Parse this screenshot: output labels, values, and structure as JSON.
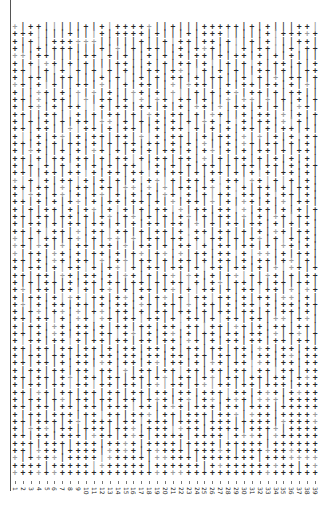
{
  "figure": {
    "title": "",
    "background_color": "#ffffff",
    "width": 324,
    "height": 521
  },
  "axes": {
    "spine_color": "#555555",
    "tick_color": "#777777",
    "y_axis_labels": [],
    "y_axis_title": "",
    "x_axis_title": "",
    "x_tick_rotation": 90
  },
  "markers": {
    "plus_glyph": "+",
    "bar_glyph": "|",
    "plus_color": "#262626",
    "bar_color": "#3a3a3a",
    "faint_color": "#9a9a9a"
  },
  "chart_data": {
    "type": "scatter",
    "title": "",
    "xlabel": "",
    "ylabel": "",
    "grid": false,
    "legend": null,
    "xlim": [
      0.5,
      39.5
    ],
    "ylim": [
      0.5,
      62.5
    ],
    "x_tick_labels": [
      "1",
      "2",
      "3",
      "4",
      "5",
      "6",
      "7",
      "8",
      "9",
      "10",
      "11",
      "12",
      "13",
      "14",
      "15",
      "16",
      "17",
      "18",
      "19",
      "20",
      "21",
      "22",
      "23",
      "24",
      "25",
      "26",
      "27",
      "28",
      "29",
      "30",
      "31",
      "32",
      "33",
      "34",
      "35",
      "36",
      "37",
      "38",
      "39"
    ],
    "y_tick_labels": [],
    "n_columns": 39,
    "n_rows": 62,
    "marker_symbols": [
      "+",
      "|"
    ],
    "series": [
      {
        "name": "plus",
        "symbol": "+",
        "description": "Thick plus-shaped markers arranged on a regular 39-column grid"
      },
      {
        "name": "bar",
        "symbol": "|",
        "description": "Thin vertical-bar markers arranged on the same 39-column grid"
      }
    ],
    "grid_pattern": [
      "+|++|||||+|+|+++++||+|||+++++|+|+|||++|",
      "+++||||+|||+|++++|+|||+|+++|||||+|+++++",
      "+|+||++++++|||||+||+|++|++|+||+|+|||++|",
      "+||+|+++|||+|+|+|++||+|+++|||+|++||+|++",
      "++|++||||++|+|+||+|+|+|++|+|++|+|+|+|||",
      "+|+|++|+|+|||++||+|+|++|+||+|+|+|++|+|+",
      "++||+|+|+|+|+|+||++|++||+|+|+||++|+||++",
      "+|++||++|||+|+||+|+|++|+|++||+|+|+|++|+",
      "++|+|+||++|+||+|++||+|+++||+|++|++|+|+|",
      "+||++|+|+|+|+||++|+|+||+|+|++|++|+|++||",
      "++|+|++||+|++|+|+|++|++|+||+|++|+|+|+|+",
      "+|++|+|++||+|++|++|+|+|++|+|++|+|+||++|",
      "++||++||+|+|++|+|++|++|+|++||+|++|+|+|+",
      "+|+|+|+|++|++|+|+|+|+|+|++|+|+|++|+|+||",
      "++|++||+|++|+|++||+|++|+|+|+|++|+|++|+|",
      "+||+|++|+|++|++|+|+|++||+|++|+|+|+|+|++",
      "++|+|+|++|+|+|++|++|+|+|+||+|++|++|+|+|",
      "+|++||+|+|++|+|+|+|++|+|++|+|+|++|+|++|",
      "++|+|++|++|+|++|+|++|++|+|+|++|+|+|+|+|",
      "+|+|+|+|+|+|+|++||+|+|+|++|+|++|++|+|++",
      "++||++|++|+|++|++|+|++|+|++|+|+|+|++|+|",
      "+|+|+|++|+|+|+|+|++|+|++|+|++|++|+|+|+|",
      "++|++|+|++|++|++|+|+|++|++|+|+|++|+|++|",
      "+|++|++|+|++|+|+|+|++|+|+|++|++|+|++|+|",
      "++|+|+|++|+|++|++|+|+|++|+|+|++|+|+|++|",
      "+|+|++|+|++|+|+|+|++|+|++|++|+|++|+|+|+",
      "++|++|++|+|++|++|+|+|++|+|++|+|+|++|++|",
      "+|++|+|++|++|+|+|++|++|+|+|++|++|+|+|+|",
      "++|+|++|+|++|++|+|++|+|++|++|+|+|++|++|",
      "+|+|++|++|+|++|+|++|++|+|++|+|++|+|+|+|",
      "++|++|+|++|++|+|++|+|++|+|++|++|+|++|+|",
      "+|++|++|+|++|+|++|++|+|++|++|+|++|+|++|",
      "++|+|++|++|+|++|++|+|++|+|++|+|++|++|+|",
      "+|++|+|++|+|++|+|++|++|+|++|++|+|+|++|+",
      "++|++|++|++|+|++|+|++|++|+|++|+|++|+|++",
      "+|+|++|+|++|++|++|+|++|+|++|++|+|++|++|",
      "++|++|++|+|++|+|++|++|+|++|+|++|++|+|++",
      "+|++|+|++|++|++|+|++|+|++|++|+|++|++|+|",
      "++|+|++|++|+|++|++|++|+|++|+|++|+|++|++",
      "+|++|++|+|++|++|+|++|++|+|++|++|+|++|+|",
      "++|++|+|++|++|++|++|+|++|+|++|++|++|++|",
      "+|++|++|++|+|++|++|++|++|++|++|+|++|++|",
      "++|+|++|++|++|++|+|++|+|++|++|++|+|++|+",
      "+|++|++|+|++|++|++|++|++|+|++|++|++|++|",
      "++|++|++|++|+|++|++|+|++|++|++|++|++|++",
      "+|++|++|++|++|++|++|++|++|++|+|++|++|++",
      "++|++|+|++|++|++|++|++|+|++|++|++|++|++",
      "+|++|++|++|++|+|++|++|++|++|++|++|++|++",
      "++|++|++|++|++|++|++|++|++|++|++|++|+++",
      "+|++|++|++|++|++|++|++|++|++|++|+++|+++",
      "++|++|++|++|++|++|++|++|+++|++|+++|++++",
      "+|++|++|++|++|++|+++|++|++|+++|+++|++++",
      "++|++|++|++|+++|++|+++|+++|++|+++|+++++",
      "+|++|+++|++|++|+++|++|+++|+++|+++|+++++",
      "++|+++|++|+++|++|+++|+++|+++|++++|+++++",
      "+|+++|++|+++|+++|+++|+++|++++|++++|++++",
      "++|++|+++|+++|+++|++++|++++|++++|++++++",
      "+++|+++|+++|++++|++++|++++|+++++|++++++",
      "++|+++|++++|++++|+++++|+++++|++++++++++",
      "+|++++|++++|+++++|+++++|+++++++|+++++++",
      "++++|+++++|++++++|++++++|+++++++++++|++",
      "+++++++++++++++++++++++++++++++++++++++"
    ]
  }
}
